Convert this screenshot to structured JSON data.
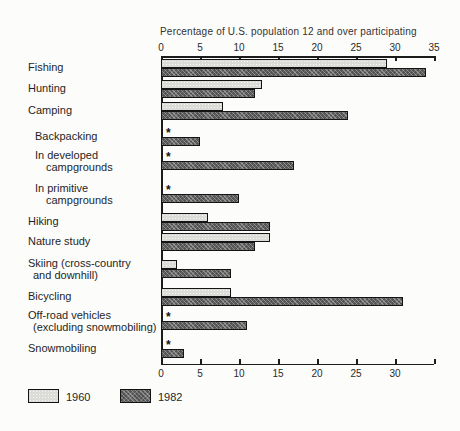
{
  "chart_data": {
    "type": "bar",
    "orientation": "horizontal",
    "title": "Percentage of U.S. population 12 and over participating",
    "axis_position": "top and bottom",
    "xlim": [
      0,
      35
    ],
    "top_axis_ticks": [
      0,
      5,
      10,
      15,
      20,
      25,
      30,
      35
    ],
    "bottom_axis_ticks": [
      0,
      5,
      10,
      15,
      20,
      25,
      30
    ],
    "grid": false,
    "no_data_marker": "*",
    "series_names": [
      "1960",
      "1982"
    ],
    "rows": [
      {
        "label": "Fishing",
        "label2": "",
        "indent": 0,
        "values": {
          "1960": 29,
          "1982": 34
        }
      },
      {
        "label": "Hunting",
        "label2": "",
        "indent": 0,
        "values": {
          "1960": 13,
          "1982": 12
        }
      },
      {
        "label": "Camping",
        "label2": "",
        "indent": 0,
        "values": {
          "1960": 8,
          "1982": 24
        }
      },
      {
        "label": "Backpacking",
        "label2": "",
        "indent": 1,
        "values": {
          "1960": null,
          "1982": 5
        }
      },
      {
        "label": "In developed",
        "label2": "campgrounds",
        "indent": 1,
        "values": {
          "1960": null,
          "1982": 17
        }
      },
      {
        "label": "In primitive",
        "label2": "campgrounds",
        "indent": 1,
        "values": {
          "1960": null,
          "1982": 10
        }
      },
      {
        "label": "Hiking",
        "label2": "",
        "indent": 0,
        "values": {
          "1960": 6,
          "1982": 14
        }
      },
      {
        "label": "Nature study",
        "label2": "",
        "indent": 0,
        "values": {
          "1960": 14,
          "1982": 12
        }
      },
      {
        "label": "Skiing (cross-country",
        "label2": "and downhill)",
        "indent": 0,
        "values": {
          "1960": 2,
          "1982": 9
        }
      },
      {
        "label": "Bicycling",
        "label2": "",
        "indent": 0,
        "values": {
          "1960": 9,
          "1982": 31
        }
      },
      {
        "label": "Off-road vehicles",
        "label2": "(excluding snowmobiling)",
        "indent": 0,
        "values": {
          "1960": null,
          "1982": 11
        }
      },
      {
        "label": "Snowmobiling",
        "label2": "",
        "indent": 0,
        "values": {
          "1960": null,
          "1982": 3
        }
      }
    ],
    "legend": [
      {
        "label": "1960"
      },
      {
        "label": "1982"
      }
    ],
    "colors": {
      "series_1960": "#dbdbd8",
      "series_1982": "#525252",
      "axis": "#1c1c1c",
      "text": "#2a2a2a",
      "background": "#fcfcfb"
    }
  }
}
